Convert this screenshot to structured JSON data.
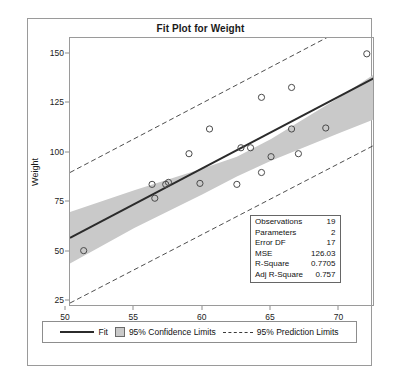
{
  "chart_data": {
    "type": "scatter",
    "title": "Fit Plot for Weight",
    "xlabel": "Height",
    "ylabel": "Weight",
    "xlim": [
      50.3,
      72.6
    ],
    "ylim": [
      22,
      158
    ],
    "xticks": [
      50,
      55,
      60,
      65,
      70
    ],
    "yticks": [
      25,
      50,
      75,
      100,
      125,
      150
    ],
    "grid": false,
    "legend_position": "bottom",
    "points": [
      {
        "x": 51.3,
        "y": 50.5
      },
      {
        "x": 56.3,
        "y": 84.0
      },
      {
        "x": 56.5,
        "y": 77.0
      },
      {
        "x": 57.3,
        "y": 84.0
      },
      {
        "x": 57.5,
        "y": 85.0
      },
      {
        "x": 59.0,
        "y": 99.5
      },
      {
        "x": 59.8,
        "y": 84.5
      },
      {
        "x": 60.5,
        "y": 112.0
      },
      {
        "x": 62.5,
        "y": 84.0
      },
      {
        "x": 62.8,
        "y": 102.5
      },
      {
        "x": 63.5,
        "y": 102.5
      },
      {
        "x": 64.3,
        "y": 90.0
      },
      {
        "x": 64.3,
        "y": 128.0
      },
      {
        "x": 65.0,
        "y": 98.0
      },
      {
        "x": 66.5,
        "y": 133.0
      },
      {
        "x": 66.5,
        "y": 112.0
      },
      {
        "x": 67.0,
        "y": 99.5
      },
      {
        "x": 69.0,
        "y": 112.5
      },
      {
        "x": 72.0,
        "y": 150.0
      }
    ],
    "fit_line": {
      "x1": 50.3,
      "y1": 57.0,
      "x2": 72.6,
      "y2": 138.0
    },
    "confidence_band": {
      "x": [
        50.3,
        55.0,
        60.0,
        62.5,
        65.0,
        70.0,
        72.6
      ],
      "lower": [
        44.0,
        62.0,
        79.0,
        88.0,
        96.0,
        110.0,
        117.0
      ],
      "upper": [
        70.0,
        81.0,
        92.0,
        98.0,
        107.0,
        128.0,
        140.0
      ]
    },
    "prediction_limits": {
      "x": [
        50.3,
        72.6
      ],
      "lower": [
        24.0,
        104.0
      ],
      "upper": [
        90.0,
        171.0
      ]
    },
    "series_labels": {
      "fit": "Fit",
      "confidence": "95% Confidence Limits",
      "prediction": "95% Prediction Limits"
    },
    "colors": {
      "fit_line": "#2b2b2b",
      "band": "#c9c9c9",
      "marker": "#4a4a4a",
      "prediction": "#3a3a3a"
    }
  },
  "stats": {
    "rows": [
      {
        "label": "Observations",
        "value": "19"
      },
      {
        "label": "Parameters",
        "value": "2"
      },
      {
        "label": "Error DF",
        "value": "17"
      },
      {
        "label": "MSE",
        "value": "126.03"
      },
      {
        "label": "R-Square",
        "value": "0.7705"
      },
      {
        "label": "Adj R-Square",
        "value": "0.757"
      }
    ]
  }
}
